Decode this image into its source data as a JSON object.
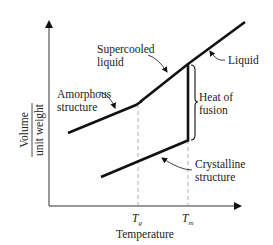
{
  "diagram": {
    "type": "volume-temperature diagram",
    "axes": {
      "y_label_numerator": "Volume",
      "y_label_denominator": "unit weight",
      "x_label": "Temperature",
      "x_ticks": [
        {
          "main": "T",
          "sub": "g"
        },
        {
          "main": "T",
          "sub": "m"
        }
      ]
    },
    "annotations": {
      "supercooled_line1": "Supercooled",
      "supercooled_line2": "liquid",
      "liquid": "Liquid",
      "amorphous_line1": "Amorphous",
      "amorphous_line2": "structure",
      "heat_line1": "Heat of",
      "heat_line2": "fusion",
      "crystalline_line1": "Crystalline",
      "crystalline_line2": "structure"
    },
    "colors": {
      "line": "#111111",
      "dashed": "#9a9a9a",
      "text": "#222222"
    }
  }
}
